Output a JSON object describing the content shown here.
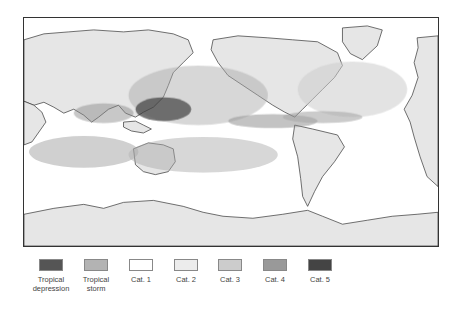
{
  "map": {
    "type": "world-map",
    "subject": "tropical cyclone tracks",
    "regions_with_tracks": [
      "Western North Pacific",
      "Eastern North Pacific",
      "North Atlantic",
      "North Indian Ocean",
      "South Indian Ocean",
      "South Pacific"
    ],
    "colors": {
      "land": "#e6e6e6",
      "ocean": "#ffffff",
      "coastline": "#333333",
      "frame": "#333333"
    }
  },
  "legend": {
    "items": [
      {
        "label": "Tropical depression",
        "line1": "Tropical",
        "line2": "depression",
        "color": "#555555"
      },
      {
        "label": "Tropical storm",
        "line1": "Tropical",
        "line2": "storm",
        "color": "#b3b3b3"
      },
      {
        "label": "Cat. 1",
        "line1": "Cat. 1",
        "line2": "",
        "color": "#ffffff"
      },
      {
        "label": "Cat. 2",
        "line1": "Cat. 2",
        "line2": "",
        "color": "#ececec"
      },
      {
        "label": "Cat. 3",
        "line1": "Cat. 3",
        "line2": "",
        "color": "#cccccc"
      },
      {
        "label": "Cat. 4",
        "line1": "Cat. 4",
        "line2": "",
        "color": "#999999"
      },
      {
        "label": "Cat. 5",
        "line1": "Cat. 5",
        "line2": "",
        "color": "#444444"
      }
    ]
  }
}
